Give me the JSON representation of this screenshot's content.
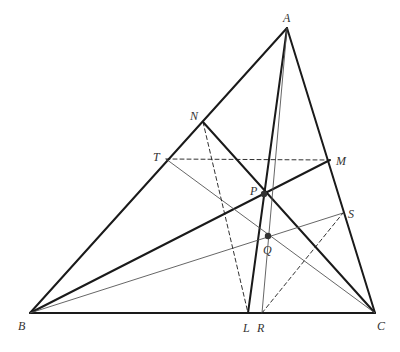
{
  "diagram": {
    "points": {
      "A": {
        "label": "A",
        "x": 287,
        "y": 28,
        "lx": 283,
        "ly": 22
      },
      "B": {
        "label": "B",
        "x": 30,
        "y": 313,
        "lx": 18,
        "ly": 330
      },
      "C": {
        "label": "C",
        "x": 375,
        "y": 313,
        "lx": 377,
        "ly": 330
      },
      "N": {
        "label": "N",
        "x": 203,
        "y": 122,
        "lx": 190,
        "ly": 120
      },
      "T": {
        "label": "T",
        "x": 166,
        "y": 159,
        "lx": 153,
        "ly": 161
      },
      "M": {
        "label": "M",
        "x": 330,
        "y": 160,
        "lx": 336,
        "ly": 165
      },
      "P": {
        "label": "P",
        "x": 264,
        "y": 194,
        "lx": 250,
        "ly": 195
      },
      "Q": {
        "label": "Q",
        "x": 268,
        "y": 236,
        "lx": 263,
        "ly": 254
      },
      "S": {
        "label": "S",
        "x": 343,
        "y": 213,
        "lx": 348,
        "ly": 218
      },
      "L": {
        "label": "L",
        "x": 248,
        "y": 313,
        "lx": 243,
        "ly": 332
      },
      "R": {
        "label": "R",
        "x": 262,
        "y": 313,
        "lx": 257,
        "ly": 332
      }
    },
    "segments_thick": [
      {
        "from": "A",
        "to": "B"
      },
      {
        "from": "A",
        "to": "C"
      },
      {
        "from": "B",
        "to": "C"
      },
      {
        "from": "A",
        "to": "L"
      },
      {
        "from": "B",
        "to": "M"
      },
      {
        "from": "C",
        "to": "N"
      }
    ],
    "segments_thin": [
      {
        "from": "A",
        "to": "R"
      },
      {
        "from": "B",
        "to": "S"
      },
      {
        "from": "C",
        "to": "T"
      }
    ],
    "segments_dashed": [
      {
        "from": "T",
        "to": "M"
      },
      {
        "from": "N",
        "to": "L"
      },
      {
        "from": "R",
        "to": "S"
      }
    ],
    "filled_points": [
      "P",
      "Q"
    ],
    "colors": {
      "stroke": "#1a1a1a",
      "thin_stroke": "#555555",
      "label": "#333333"
    }
  }
}
